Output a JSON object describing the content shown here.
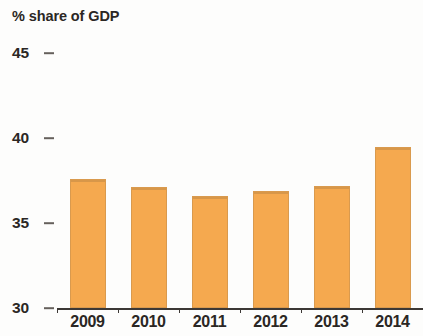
{
  "chart_data": {
    "type": "bar",
    "title": "% share of GDP",
    "xlabel": "",
    "ylabel": "% share of GDP",
    "categories": [
      "2009",
      "2010",
      "2011",
      "2012",
      "2013",
      "2014"
    ],
    "values": [
      37.6,
      37.1,
      36.6,
      36.9,
      37.2,
      39.5
    ],
    "series": [
      {
        "name": "% share of GDP",
        "values": [
          37.6,
          37.1,
          36.6,
          36.9,
          37.2,
          39.5
        ]
      }
    ],
    "ylim": [
      30,
      45
    ],
    "y_ticks": [
      45,
      40,
      35,
      30
    ],
    "y_tick_labels": [
      "45",
      "40",
      "35",
      "30"
    ],
    "grid": false,
    "legend": false,
    "legend_position": "none",
    "bar_color": "#f5a94f",
    "bar_edge_color": "#d99a4e",
    "axis_color": "#3c3835",
    "text_color": "#2b2724",
    "background_color": "#fdfdfc",
    "annotations": []
  }
}
